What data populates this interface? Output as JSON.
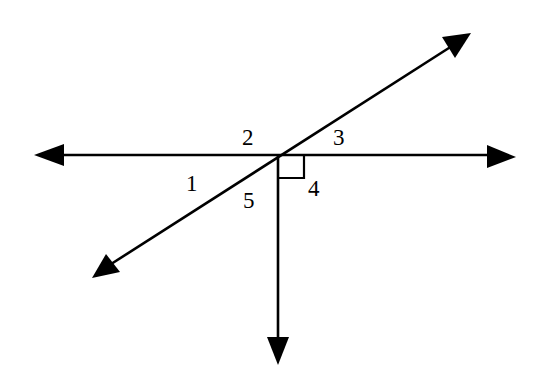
{
  "diagram": {
    "type": "geometry-angles",
    "colors": {
      "ink": "#000000",
      "background": "#ffffff"
    },
    "intersection": {
      "x": 278,
      "y": 155
    },
    "lines": {
      "horizontal": {
        "x1": 50,
        "y1": 155,
        "x2": 496,
        "y2": 155,
        "arrows": [
          "left",
          "right"
        ]
      },
      "diagonal": {
        "x1": 108,
        "y1": 266,
        "x2": 452,
        "y2": 46,
        "arrows": [
          "lower-left",
          "upper-right"
        ]
      },
      "vertical_ray": {
        "x1": 278,
        "y1": 155,
        "x2": 278,
        "y2": 345,
        "arrows": [
          "down"
        ]
      }
    },
    "right_angle_mark": {
      "x": 278,
      "y": 155,
      "size": 25
    },
    "labels": [
      {
        "id": "angle-1",
        "text": "1",
        "x": 186,
        "y": 191
      },
      {
        "id": "angle-2",
        "text": "2",
        "x": 242,
        "y": 145
      },
      {
        "id": "angle-3",
        "text": "3",
        "x": 333,
        "y": 145
      },
      {
        "id": "angle-4",
        "text": "4",
        "x": 308,
        "y": 196
      },
      {
        "id": "angle-5",
        "text": "5",
        "x": 243,
        "y": 208
      }
    ]
  }
}
